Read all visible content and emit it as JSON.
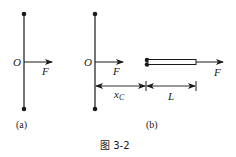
{
  "figure": {
    "caption": "图 3-2",
    "panels": [
      {
        "id": "a",
        "label": "(a)",
        "pivot_label": "O",
        "force_label": "F"
      },
      {
        "id": "b",
        "label": "(b)",
        "pivot_label": "O",
        "force_label_left": "F",
        "force_label_right": "F",
        "dimension_xc_label": "x",
        "dimension_xc_subscript": "C",
        "dimension_length_label": "L"
      }
    ]
  },
  "colors": {
    "ink": "#1a1a1a",
    "background": "#ffffff"
  }
}
